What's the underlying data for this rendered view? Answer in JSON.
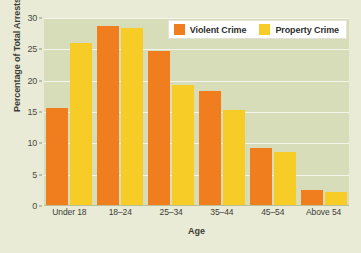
{
  "chart_data": {
    "type": "bar",
    "title": "",
    "xlabel": "Age",
    "ylabel": "Percentage of Total Arrests",
    "categories": [
      "Under 18",
      "18–24",
      "25–34",
      "35–44",
      "45–54",
      "Above 54"
    ],
    "series": [
      {
        "name": "Violent Crime",
        "color": "#f07d1e",
        "values": [
          15.6,
          28.7,
          24.8,
          18.3,
          9.2,
          2.5
        ]
      },
      {
        "name": "Property Crime",
        "color": "#f8cc27",
        "values": [
          26.0,
          28.4,
          19.3,
          15.4,
          8.6,
          2.2
        ]
      }
    ],
    "ylim": [
      0,
      30
    ],
    "yticks": [
      0,
      5,
      10,
      15,
      20,
      25,
      30
    ],
    "ytick_labels": [
      "0",
      "5",
      "10",
      "15",
      "20",
      "25",
      "30"
    ],
    "grid": true,
    "grid_orientation": "horizontal",
    "legend_position": "top-right",
    "plot_background": "#d7ddb8",
    "figure_background": "#e9ebd6"
  },
  "legend": {
    "entries": [
      {
        "label": "Violent Crime",
        "swatch": "violent"
      },
      {
        "label": "Property Crime",
        "swatch": "property"
      }
    ]
  }
}
